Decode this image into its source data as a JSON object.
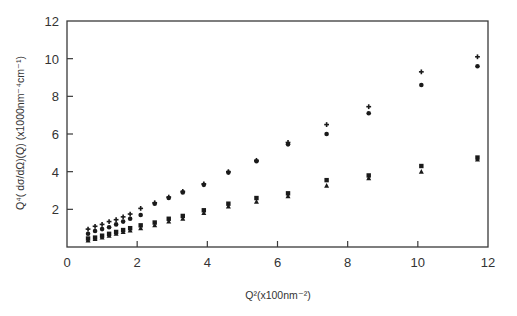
{
  "chart_data": {
    "type": "scatter",
    "title": "",
    "xlabel": "Q²(x100nm⁻²)",
    "ylabel": "Q⁴( dσ/dΩ)(Q)  (x1000nm⁻⁴cm⁻¹)",
    "xlim": [
      0,
      12
    ],
    "ylim": [
      0,
      12
    ],
    "xticks": [
      0,
      2,
      4,
      6,
      8,
      10,
      12
    ],
    "yticks": [
      2,
      4,
      6,
      8,
      10,
      12
    ],
    "grid": false,
    "legend": null,
    "series": [
      {
        "name": "plus",
        "marker": "plus",
        "x": [
          0.6,
          0.8,
          1.0,
          1.2,
          1.4,
          1.6,
          1.8,
          2.1,
          2.5,
          2.9,
          3.3,
          3.9,
          4.6,
          5.4,
          6.3,
          7.4,
          8.6,
          10.1,
          11.7
        ],
        "y": [
          0.95,
          1.1,
          1.2,
          1.35,
          1.45,
          1.6,
          1.75,
          2.05,
          2.35,
          2.65,
          2.95,
          3.35,
          4.0,
          4.6,
          5.55,
          6.5,
          7.45,
          9.3,
          10.1
        ]
      },
      {
        "name": "circle",
        "marker": "circle",
        "x": [
          0.6,
          0.8,
          1.0,
          1.2,
          1.4,
          1.6,
          1.8,
          2.1,
          2.5,
          2.9,
          3.3,
          3.9,
          4.6,
          5.4,
          6.3,
          7.4,
          8.6,
          10.1,
          11.7
        ],
        "y": [
          0.7,
          0.85,
          0.95,
          1.05,
          1.2,
          1.35,
          1.5,
          1.7,
          2.3,
          2.6,
          2.9,
          3.3,
          3.95,
          4.55,
          5.45,
          6.0,
          7.1,
          8.6,
          9.6
        ]
      },
      {
        "name": "square",
        "marker": "square",
        "x": [
          0.6,
          0.8,
          1.0,
          1.2,
          1.4,
          1.6,
          1.8,
          2.1,
          2.5,
          2.9,
          3.3,
          3.9,
          4.6,
          5.4,
          6.3,
          7.4,
          8.6,
          10.1,
          11.7
        ],
        "y": [
          0.45,
          0.5,
          0.6,
          0.7,
          0.8,
          0.9,
          1.0,
          1.15,
          1.3,
          1.5,
          1.65,
          1.95,
          2.3,
          2.6,
          2.85,
          3.55,
          3.8,
          4.3,
          4.75
        ]
      },
      {
        "name": "triangle",
        "marker": "triangle",
        "x": [
          0.6,
          0.8,
          1.0,
          1.2,
          1.4,
          1.6,
          1.8,
          2.1,
          2.5,
          2.9,
          3.3,
          3.9,
          4.6,
          5.4,
          6.3,
          7.4,
          8.6,
          10.1,
          11.7
        ],
        "y": [
          0.35,
          0.42,
          0.5,
          0.6,
          0.7,
          0.8,
          0.88,
          1.0,
          1.15,
          1.35,
          1.5,
          1.8,
          2.15,
          2.4,
          2.7,
          3.25,
          3.65,
          4.0,
          4.65
        ]
      }
    ]
  },
  "colors": {
    "axis": "#3a3a3a",
    "marker": "#1a1a1a",
    "background": "#ffffff"
  }
}
